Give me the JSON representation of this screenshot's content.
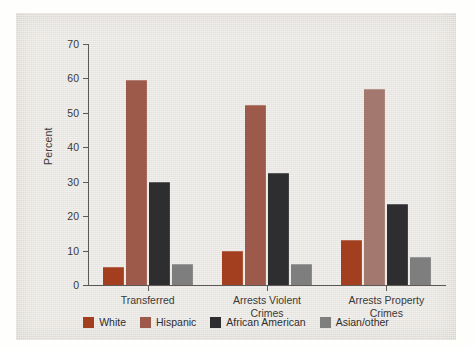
{
  "chart_data": {
    "type": "bar",
    "title": "",
    "xlabel": "",
    "ylabel": "Percent",
    "ylim": [
      0,
      70
    ],
    "yticks": [
      0,
      10,
      20,
      30,
      40,
      50,
      60,
      70
    ],
    "ytick_labels": [
      "0",
      "10",
      "20",
      "30",
      "40",
      "50",
      "60",
      "70"
    ],
    "grid": false,
    "legend_position": "bottom",
    "categories": [
      "Transferred",
      "Arrests Violent\nCrimes",
      "Arrests Property\nCrimes"
    ],
    "series": [
      {
        "name": "White",
        "color": "#a33f1f",
        "values": [
          5.2,
          10.0,
          13.0
        ]
      },
      {
        "name": "Hispanic",
        "color": "#9d5a4b",
        "values": [
          59.5,
          52.3,
          57.0
        ]
      },
      {
        "name": "African American",
        "color": "#2e2e30",
        "values": [
          30.0,
          32.6,
          23.5
        ]
      },
      {
        "name": "Asian/other",
        "color": "#7e7e7e",
        "values": [
          6.2,
          6.2,
          8.0
        ]
      }
    ],
    "series_color_overrides": [
      {
        "series": "Hispanic",
        "category_index": 2,
        "color": "#a3786e"
      }
    ]
  },
  "legend": {
    "items": [
      {
        "label": "White",
        "color": "#a33f1f"
      },
      {
        "label": "Hispanic",
        "color": "#9d5a4b"
      },
      {
        "label": "African American",
        "color": "#2e2e30"
      },
      {
        "label": "Asian/other",
        "color": "#7e7e7e"
      }
    ]
  },
  "colors": {
    "panel_background": "#eae7e2",
    "page_background": "#fefefd",
    "axis": "#5d5a57",
    "text": "#3b3936"
  }
}
